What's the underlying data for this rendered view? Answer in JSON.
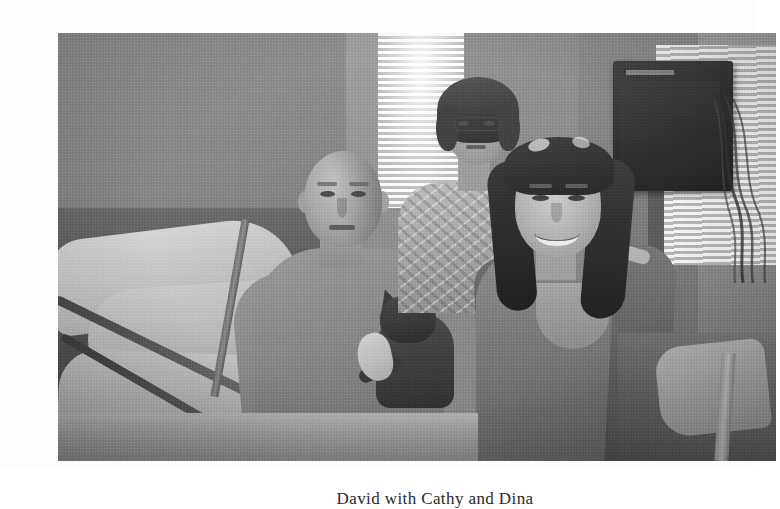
{
  "document": {
    "type": "scanned-book-page",
    "background_color": "#fdfdfd"
  },
  "figure": {
    "name": "hospital-room-group-photo",
    "alt": "Three people posing in a hospital room: a bald man seated in a hospital bed holding a dark cat, an older woman with curly dark hair standing behind, and a young woman with long dark hair smiling beside him.",
    "border_color": "#5a5a5a",
    "tone": "black-and-white halftone scan",
    "subjects": [
      {
        "id": "seated-man",
        "label": "Bald man seated in hospital bed",
        "position": "center-left"
      },
      {
        "id": "standing-woman",
        "label": "Older woman with curly dark hair standing behind",
        "position": "center-back"
      },
      {
        "id": "young-woman",
        "label": "Young woman with long dark hair, smiling",
        "position": "right"
      },
      {
        "id": "cat",
        "label": "Dark cat resting in the man's lap",
        "position": "center"
      }
    ],
    "scene_elements": [
      "hospital bed with white pillows",
      "metal bed rail",
      "horizontal window blinds",
      "wall-mounted monitor with hanging cables",
      "IV pole"
    ]
  },
  "caption": {
    "text": "David with Cathy and Dina",
    "note": "clipped at bottom edge of screenshot"
  }
}
